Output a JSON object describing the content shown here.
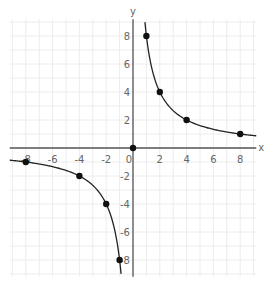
{
  "chart_data": {
    "type": "line",
    "title": "",
    "function": "y = 8/x",
    "xlabel": "x",
    "ylabel": "y",
    "xlim": [
      -9.2,
      9.2
    ],
    "ylim": [
      -9.2,
      9.2
    ],
    "grid": true,
    "grid_step": 1,
    "x_ticks": [
      -8,
      -6,
      -4,
      -2,
      0,
      2,
      4,
      6,
      8
    ],
    "x_tick_labels": [
      "-8",
      "-6",
      "-4",
      "-2",
      "0",
      "2",
      "4",
      "6",
      "8"
    ],
    "y_ticks": [
      8,
      6,
      4,
      2,
      -2,
      -4,
      -6,
      -8
    ],
    "y_tick_labels": [
      "8",
      "6",
      "4",
      "2",
      "-2",
      "-4",
      "-6",
      "-8"
    ],
    "series": [
      {
        "name": "branch-positive",
        "x_range": [
          0.89,
          9.2
        ],
        "points": [
          [
            1,
            8
          ],
          [
            2,
            4
          ],
          [
            4,
            2
          ],
          [
            8,
            1
          ]
        ]
      },
      {
        "name": "branch-negative",
        "x_range": [
          -9.2,
          -0.89
        ],
        "points": [
          [
            -8,
            -1
          ],
          [
            -4,
            -2
          ],
          [
            -2,
            -4
          ],
          [
            -1,
            -8
          ]
        ]
      }
    ],
    "extra_points": [
      [
        0,
        0
      ]
    ],
    "colors": {
      "curve": "#222222",
      "point": "#111111",
      "axis": "#555555",
      "grid": "#ececec"
    }
  }
}
